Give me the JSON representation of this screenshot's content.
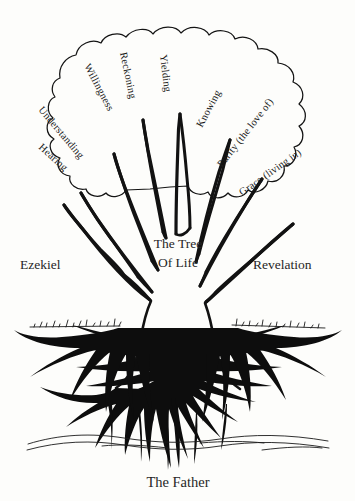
{
  "diagram": {
    "title_line_1": "The Tree",
    "title_line_2": "Of Life",
    "left_side_label": "Ezekiel",
    "right_side_label": "Revelation",
    "bottom_label": "The Father",
    "ink_color": "#121212",
    "background_color": "#fdfdfb"
  },
  "branches": [
    {
      "id": "hearing",
      "label": "Hearing",
      "side": "left",
      "angle": 42
    },
    {
      "id": "understanding",
      "label": "Understanding",
      "side": "left",
      "angle": 50
    },
    {
      "id": "willingness",
      "label": "Willingness",
      "side": "left",
      "angle": 62
    },
    {
      "id": "reckoning",
      "label": "Reckoning",
      "side": "left",
      "angle": 78
    },
    {
      "id": "yielding",
      "label": "Yielding",
      "side": "center",
      "angle": 83
    },
    {
      "id": "knowing",
      "label": "Knowing",
      "side": "right",
      "angle": -62
    },
    {
      "id": "purity",
      "label": "Purity (the love of)",
      "side": "right",
      "angle": -52
    },
    {
      "id": "grace",
      "label": "Grace (living in)",
      "side": "right",
      "angle": -35
    }
  ]
}
